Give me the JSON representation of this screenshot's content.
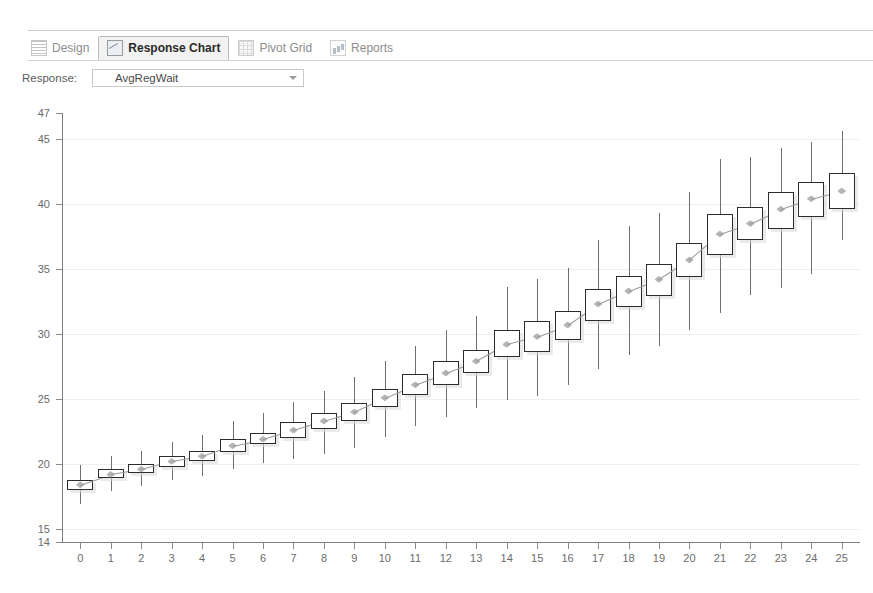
{
  "window": {
    "tabs": [
      {
        "label": "Design",
        "icon": "design-icon",
        "active": false
      },
      {
        "label": "Response Chart",
        "icon": "chart-icon",
        "active": true
      },
      {
        "label": "Pivot Grid",
        "icon": "grid-icon",
        "active": false
      },
      {
        "label": "Reports",
        "icon": "report-icon",
        "active": false
      }
    ]
  },
  "toolbar": {
    "response_label": "Response:",
    "response_value": "AvgRegWait",
    "response_caret_icon": "chevron-down-icon"
  },
  "chart_data": {
    "type": "box",
    "title": "",
    "xlabel": "",
    "ylabel": "",
    "xlim": [
      -0.6,
      25.6
    ],
    "ylim": [
      14,
      47
    ],
    "yticks": [
      14,
      15,
      20,
      25,
      30,
      35,
      40,
      45,
      47
    ],
    "gridlines": [
      45,
      40,
      35,
      30,
      25,
      20,
      15
    ],
    "xticks": [
      0,
      1,
      2,
      3,
      4,
      5,
      6,
      7,
      8,
      9,
      10,
      11,
      12,
      13,
      14,
      15,
      16,
      17,
      18,
      19,
      20,
      21,
      22,
      23,
      24,
      25
    ],
    "grid": true,
    "legend": null,
    "series_name": "AvgRegWait",
    "boxes": [
      {
        "x": 0,
        "whisker_low": 16.9,
        "q1": 18.0,
        "median": 18.4,
        "q3": 18.8,
        "whisker_high": 19.9
      },
      {
        "x": 1,
        "whisker_low": 17.9,
        "q1": 18.9,
        "median": 19.2,
        "q3": 19.6,
        "whisker_high": 20.6
      },
      {
        "x": 2,
        "whisker_low": 18.3,
        "q1": 19.3,
        "median": 19.6,
        "q3": 20.0,
        "whisker_high": 21.0
      },
      {
        "x": 3,
        "whisker_low": 18.8,
        "q1": 19.8,
        "median": 20.2,
        "q3": 20.6,
        "whisker_high": 21.7
      },
      {
        "x": 4,
        "whisker_low": 19.1,
        "q1": 20.2,
        "median": 20.6,
        "q3": 21.0,
        "whisker_high": 22.2
      },
      {
        "x": 5,
        "whisker_low": 19.6,
        "q1": 20.9,
        "median": 21.4,
        "q3": 21.9,
        "whisker_high": 23.3
      },
      {
        "x": 6,
        "whisker_low": 20.1,
        "q1": 21.5,
        "median": 21.9,
        "q3": 22.4,
        "whisker_high": 23.9
      },
      {
        "x": 7,
        "whisker_low": 20.4,
        "q1": 22.0,
        "median": 22.6,
        "q3": 23.2,
        "whisker_high": 24.8
      },
      {
        "x": 8,
        "whisker_low": 20.8,
        "q1": 22.7,
        "median": 23.3,
        "q3": 23.9,
        "whisker_high": 25.6
      },
      {
        "x": 9,
        "whisker_low": 21.2,
        "q1": 23.3,
        "median": 24.0,
        "q3": 24.7,
        "whisker_high": 26.7
      },
      {
        "x": 10,
        "whisker_low": 22.1,
        "q1": 24.4,
        "median": 25.1,
        "q3": 25.8,
        "whisker_high": 27.9
      },
      {
        "x": 11,
        "whisker_low": 22.9,
        "q1": 25.3,
        "median": 26.1,
        "q3": 26.9,
        "whisker_high": 29.1
      },
      {
        "x": 12,
        "whisker_low": 23.6,
        "q1": 26.1,
        "median": 27.0,
        "q3": 27.9,
        "whisker_high": 30.3
      },
      {
        "x": 13,
        "whisker_low": 24.3,
        "q1": 27.0,
        "median": 27.9,
        "q3": 28.8,
        "whisker_high": 31.4
      },
      {
        "x": 14,
        "whisker_low": 24.9,
        "q1": 28.2,
        "median": 29.2,
        "q3": 30.3,
        "whisker_high": 33.6
      },
      {
        "x": 15,
        "whisker_low": 25.2,
        "q1": 28.6,
        "median": 29.8,
        "q3": 31.0,
        "whisker_high": 34.2
      },
      {
        "x": 16,
        "whisker_low": 26.1,
        "q1": 29.5,
        "median": 30.7,
        "q3": 31.8,
        "whisker_high": 35.1
      },
      {
        "x": 17,
        "whisker_low": 27.3,
        "q1": 31.0,
        "median": 32.3,
        "q3": 33.5,
        "whisker_high": 37.2
      },
      {
        "x": 18,
        "whisker_low": 28.4,
        "q1": 32.1,
        "median": 33.3,
        "q3": 34.5,
        "whisker_high": 38.3
      },
      {
        "x": 19,
        "whisker_low": 29.1,
        "q1": 32.9,
        "median": 34.2,
        "q3": 35.4,
        "whisker_high": 39.3
      },
      {
        "x": 20,
        "whisker_low": 30.3,
        "q1": 34.4,
        "median": 35.7,
        "q3": 37.0,
        "whisker_high": 40.9
      },
      {
        "x": 21,
        "whisker_low": 31.6,
        "q1": 36.1,
        "median": 37.7,
        "q3": 39.2,
        "whisker_high": 43.5
      },
      {
        "x": 22,
        "whisker_low": 33.0,
        "q1": 37.2,
        "median": 38.5,
        "q3": 39.8,
        "whisker_high": 43.6
      },
      {
        "x": 23,
        "whisker_low": 33.5,
        "q1": 38.1,
        "median": 39.6,
        "q3": 40.9,
        "whisker_high": 44.3
      },
      {
        "x": 24,
        "whisker_low": 34.6,
        "q1": 39.0,
        "median": 40.4,
        "q3": 41.7,
        "whisker_high": 44.8
      },
      {
        "x": 25,
        "whisker_low": 37.2,
        "q1": 39.6,
        "median": 41.0,
        "q3": 42.4,
        "whisker_high": 45.6
      }
    ]
  }
}
